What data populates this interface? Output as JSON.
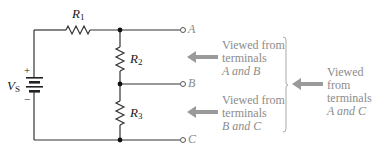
{
  "circuit": {
    "source": {
      "symbol": "V",
      "subscript": "S",
      "plus": "+",
      "minus": "−"
    },
    "resistors": [
      {
        "symbol": "R",
        "subscript": "1"
      },
      {
        "symbol": "R",
        "subscript": "2"
      },
      {
        "symbol": "R",
        "subscript": "3"
      }
    ],
    "terminals": [
      "A",
      "B",
      "C"
    ]
  },
  "annotations": [
    {
      "line1": "Viewed from",
      "line2": "terminals",
      "line3": "A and B"
    },
    {
      "line1": "Viewed from",
      "line2": "terminals",
      "line3": "B and C"
    },
    {
      "line1": "Viewed from",
      "line2": "terminals",
      "line3": "A and C"
    }
  ],
  "colors": {
    "wire": "#333333",
    "annotation_text": "#8c8c8c",
    "arrow": "#9a9a9a",
    "brace": "#aaaaaa"
  }
}
